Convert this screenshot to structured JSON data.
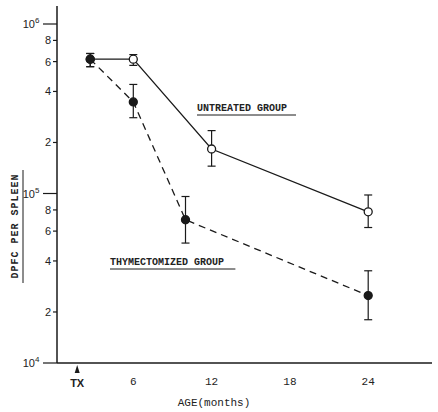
{
  "chart_data": {
    "type": "line",
    "title": "",
    "xlabel": "AGE(months)",
    "ylabel": "DPFC PER SPLEEN",
    "yscale": "log",
    "ylim": [
      10000,
      1000000
    ],
    "xlim": [
      0,
      29
    ],
    "grid": false,
    "legend_position": "inline annotations",
    "x_ticks": [
      {
        "value": 1.7,
        "label": "TX",
        "arrow": true
      },
      {
        "value": 6,
        "label": "6"
      },
      {
        "value": 12,
        "label": "12"
      },
      {
        "value": 18,
        "label": "18"
      },
      {
        "value": 24,
        "label": "24"
      }
    ],
    "y_ticks": [
      {
        "value": 10000,
        "label": "10",
        "sup": "4",
        "major": true
      },
      {
        "value": 20000,
        "label": "2"
      },
      {
        "value": 40000,
        "label": "4"
      },
      {
        "value": 60000,
        "label": "6"
      },
      {
        "value": 80000,
        "label": "8"
      },
      {
        "value": 100000,
        "label": "10",
        "sup": "5",
        "major": true
      },
      {
        "value": 200000,
        "label": "2"
      },
      {
        "value": 400000,
        "label": "4"
      },
      {
        "value": 600000,
        "label": "6"
      },
      {
        "value": 800000,
        "label": "8"
      },
      {
        "value": 1000000,
        "label": "10",
        "sup": "6",
        "major": true
      }
    ],
    "series": [
      {
        "name": "UNTREATED GROUP",
        "style": "solid",
        "marker": "open-circle",
        "label_position": {
          "x": 197,
          "y": 111
        },
        "points": [
          {
            "x": 2.7,
            "y": 620000,
            "err_low": 560000,
            "err_high": 670000
          },
          {
            "x": 6,
            "y": 620000,
            "err_low": 570000,
            "err_high": 660000
          },
          {
            "x": 12,
            "y": 183000,
            "err_low": 145000,
            "err_high": 235000
          },
          {
            "x": 24,
            "y": 78000,
            "err_low": 63000,
            "err_high": 98000
          }
        ]
      },
      {
        "name": "THYMECTOMIZED GROUP",
        "style": "dashed",
        "marker": "filled-circle",
        "label_position": {
          "x": 110,
          "y": 265
        },
        "points": [
          {
            "x": 2.7,
            "y": 620000,
            "err_low": 560000,
            "err_high": 670000
          },
          {
            "x": 6,
            "y": 347000,
            "err_low": 280000,
            "err_high": 440000
          },
          {
            "x": 10,
            "y": 70000,
            "err_low": 51000,
            "err_high": 96000
          },
          {
            "x": 24,
            "y": 25000,
            "err_low": 18000,
            "err_high": 35000
          }
        ]
      }
    ]
  },
  "colors": {
    "ink": "#1a1a1a",
    "background": "#ffffff"
  }
}
